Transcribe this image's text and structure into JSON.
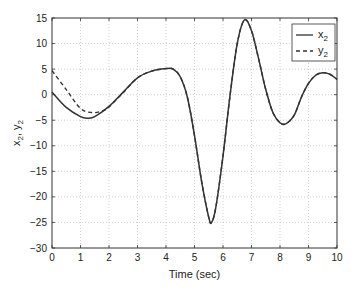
{
  "chart_data": {
    "type": "line",
    "title": "",
    "xlabel": "Time (sec)",
    "ylabel": "x2, y2",
    "ylabel_parts": {
      "a": "x",
      "a_sub": "2",
      "sep": ", ",
      "b": "y",
      "b_sub": "2"
    },
    "xlim": [
      0,
      10
    ],
    "ylim": [
      -30,
      15
    ],
    "xticks": [
      0,
      1,
      2,
      3,
      4,
      5,
      6,
      7,
      8,
      9,
      10
    ],
    "yticks": [
      15,
      10,
      5,
      0,
      -5,
      -10,
      -15,
      -20,
      -25,
      -30
    ],
    "xtick_labels": [
      "0",
      "1",
      "2",
      "3",
      "4",
      "5",
      "6",
      "7",
      "8",
      "9",
      "10"
    ],
    "ytick_labels": [
      "15",
      "10",
      "5",
      "0",
      "−5",
      "−10",
      "−15",
      "−20",
      "−25",
      "−30"
    ],
    "grid": true,
    "legend_position": "upper right",
    "series": [
      {
        "name": "x2",
        "label_base": "x",
        "label_sub": "2",
        "style": "solid",
        "color": "#333333",
        "x": [
          0,
          0.5,
          1,
          1.25,
          1.5,
          2,
          2.5,
          3,
          3.5,
          4,
          4.25,
          4.5,
          4.75,
          5,
          5.25,
          5.5,
          5.6,
          5.75,
          6,
          6.25,
          6.5,
          6.75,
          7,
          7.25,
          7.5,
          7.75,
          8,
          8.2,
          8.5,
          8.75,
          9,
          9.25,
          9.5,
          9.75,
          10
        ],
        "values": [
          0.5,
          -2.5,
          -4.3,
          -4.6,
          -4.3,
          -2.3,
          0.5,
          3.3,
          4.6,
          5.1,
          5.0,
          3.5,
          -0.5,
          -8,
          -17,
          -24,
          -25,
          -22,
          -12,
          0,
          10,
          14.6,
          12.5,
          7,
          1,
          -3.5,
          -5.5,
          -5.7,
          -4,
          -0.5,
          2.2,
          3.8,
          4.3,
          4.0,
          3.0
        ]
      },
      {
        "name": "y2",
        "label_base": "y",
        "label_sub": "2",
        "style": "dashed",
        "color": "#333333",
        "x": [
          0,
          0.5,
          1,
          1.4,
          1.75,
          2,
          2.5,
          3,
          3.5,
          4,
          4.25,
          4.5,
          4.75,
          5,
          5.25,
          5.5,
          5.6,
          5.75,
          6,
          6.25,
          6.5,
          6.75,
          7,
          7.25,
          7.5,
          7.75,
          8,
          8.2,
          8.5,
          8.75,
          9,
          9.25,
          9.5,
          9.75,
          10
        ],
        "values": [
          4.7,
          1.0,
          -2.7,
          -3.5,
          -3.2,
          -2.4,
          0.4,
          3.3,
          4.6,
          5.1,
          5.0,
          3.5,
          -0.5,
          -8,
          -17,
          -24,
          -25,
          -22,
          -12,
          0,
          10,
          14.6,
          12.5,
          7,
          1,
          -3.5,
          -5.5,
          -5.7,
          -4,
          -0.5,
          2.2,
          3.8,
          4.3,
          4.0,
          3.0
        ]
      }
    ]
  },
  "colors": {
    "axis": "#333333",
    "grid": "#bbbbbb",
    "line": "#333333",
    "background": "#ffffff"
  }
}
